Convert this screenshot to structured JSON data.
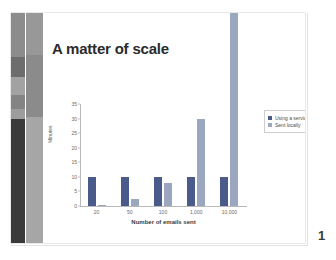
{
  "slide": {
    "title": "A matter of scale",
    "page_number": "1",
    "sidebar": {
      "outer_strip_colors": [
        "#8c8c8c",
        "#6d6d6d",
        "#a2a2a2",
        "#848484",
        "#9d9d9d",
        "#3a3a3a"
      ],
      "inner_strip_colors": [
        "#989898",
        "#8b8b8b",
        "#a6a6a6"
      ]
    }
  },
  "chart_data": {
    "type": "bar",
    "title": "A matter of scale",
    "xlabel": "Number of emails sent",
    "ylabel": "Minutes",
    "categories": [
      "20",
      "50",
      "100",
      "1,000",
      "10,000"
    ],
    "series": [
      {
        "name": "Using a service",
        "color": "#4a5a8a",
        "values": [
          10,
          10,
          10,
          10,
          10
        ]
      },
      {
        "name": "Sent locally",
        "color": "#9aa7be",
        "values": [
          0.5,
          2.5,
          8,
          30,
          120
        ]
      }
    ],
    "ylim": [
      0,
      35
    ],
    "yticks": [
      "0",
      "5",
      "10",
      "15",
      "20",
      "25",
      "30",
      "35"
    ],
    "grid": false,
    "legend_position": "right",
    "annotations": [
      "The 'Sent locally' bar for 10,000 emails exceeds the plot area and extends off the top of the chart."
    ]
  },
  "legend": {
    "items": [
      {
        "label": "Using a service",
        "color": "#4a5a8a"
      },
      {
        "label": "Sent locally",
        "color": "#9aa7be"
      }
    ]
  }
}
